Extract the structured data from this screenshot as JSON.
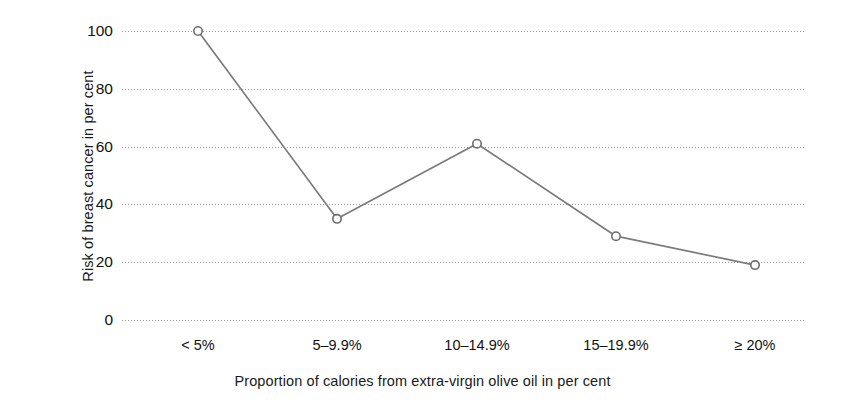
{
  "chart_data": {
    "type": "line",
    "title": "",
    "subtitle": "",
    "xlabel": "Proportion of calories from extra-virgin olive oil in per cent",
    "ylabel": "Risk of breast cancer in per cent",
    "categories": [
      "< 5%",
      "5–9.9%",
      "10–14.9%",
      "15–19.9%",
      "≥ 20%"
    ],
    "values": [
      100,
      35,
      61,
      29,
      19
    ],
    "series": [
      {
        "name": "Risk of breast cancer",
        "values": [
          100,
          35,
          61,
          29,
          19
        ]
      }
    ],
    "ylim": [
      0,
      100
    ],
    "yticks": [
      0,
      20,
      40,
      60,
      80,
      100
    ],
    "ytick_labels": [
      "0",
      "20",
      "40",
      "60",
      "80",
      "100"
    ],
    "grid": "horizontal-dotted",
    "legend": "none",
    "line_color": "#7b7b7b",
    "marker": "open-circle",
    "marker_fill": "#ffffff",
    "marker_edge_color": "#6e6e6e",
    "grid_color": "#9a9a9a",
    "background_color": "#ffffff",
    "text_color": "#1a1a1a"
  }
}
